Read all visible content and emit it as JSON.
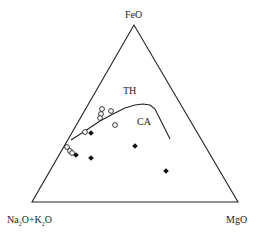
{
  "diagram": {
    "type": "AFM ternary diagram",
    "vertices": {
      "top": "FeO",
      "bottom_left_parts": [
        "Na",
        "2",
        "O+K",
        "2",
        "O"
      ],
      "bottom_right": "MgO"
    },
    "field_labels": {
      "upper": "TH",
      "lower": "CA"
    },
    "colors": {
      "line": "#222222",
      "marker": "#111111"
    }
  },
  "chart_data": {
    "type": "scatter",
    "title": "",
    "ternary_axes": [
      "FeO",
      "Na2O+K2O",
      "MgO"
    ],
    "boundary_curve_label": "TH / CA boundary",
    "regions": [
      "TH (tholeiitic)",
      "CA (calc-alkaline)"
    ],
    "series": [
      {
        "name": "open-circles",
        "marker": "open circle",
        "points_px": [
          [
            102,
            109
          ],
          [
            101,
            114
          ],
          [
            100,
            118
          ],
          [
            111,
            111
          ],
          [
            115,
            125
          ],
          [
            85,
            132
          ],
          [
            67,
            147
          ],
          [
            70,
            151
          ],
          [
            72,
            153
          ]
        ]
      },
      {
        "name": "filled-diamonds",
        "marker": "filled diamond",
        "points_px": [
          [
            91,
            133
          ],
          [
            76,
            155
          ],
          [
            91,
            158
          ],
          [
            135,
            146
          ],
          [
            166,
            171
          ]
        ]
      }
    ],
    "boundary_curve_px": [
      [
        71,
        140
      ],
      [
        85,
        131
      ],
      [
        100,
        121
      ],
      [
        113,
        114
      ],
      [
        125,
        108
      ],
      [
        135,
        105
      ],
      [
        143,
        104
      ],
      [
        150,
        105
      ],
      [
        155,
        109
      ],
      [
        160,
        119
      ],
      [
        165,
        129
      ],
      [
        170,
        139
      ]
    ]
  }
}
